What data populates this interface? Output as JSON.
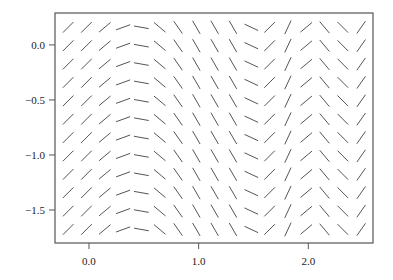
{
  "chart_data": {
    "type": "slope-field",
    "title": "",
    "xlabel": "",
    "ylabel": "",
    "xlim": [
      -0.31,
      2.59
    ],
    "ylim": [
      -1.8,
      0.29
    ],
    "grid": false,
    "legend": null,
    "x_ticks": [
      {
        "value": 0.0,
        "label": "0.0"
      },
      {
        "value": 1.0,
        "label": "1.0"
      },
      {
        "value": 2.0,
        "label": "2.0"
      }
    ],
    "y_ticks": [
      {
        "value": 0.0,
        "label": "0.0"
      },
      {
        "value": -0.5,
        "label": "−0.5"
      },
      {
        "value": -1.0,
        "label": "−1.0"
      },
      {
        "value": -1.5,
        "label": "−1.5"
      }
    ],
    "field": {
      "x_start": -0.19,
      "x_step": 0.167,
      "columns": 17,
      "y_start": 0.16,
      "y_step": -0.167,
      "rows": 12,
      "segment_length_px": 15,
      "column_angles_deg": [
        45,
        45,
        40,
        20,
        -10,
        -40,
        -55,
        -60,
        -60,
        -60,
        -25,
        45,
        65,
        40,
        -50,
        -45,
        55
      ]
    },
    "colors": {
      "segment": "#555555",
      "frame": "#555555",
      "text": "#222222"
    }
  }
}
